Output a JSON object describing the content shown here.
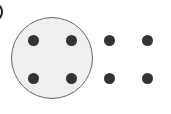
{
  "diagram": {
    "colors": {
      "background": "#ffffff",
      "circle_fill": "#efefef",
      "circle_border": "#666666",
      "dot": "#333333"
    },
    "group_circle": {
      "cx": 52,
      "cy": 58,
      "r": 41
    },
    "dot_diameter": 11,
    "dots": [
      {
        "x": 33,
        "y": 40,
        "grouped": true
      },
      {
        "x": 71,
        "y": 40,
        "grouped": true
      },
      {
        "x": 109,
        "y": 40,
        "grouped": false
      },
      {
        "x": 147,
        "y": 40,
        "grouped": false
      },
      {
        "x": 33,
        "y": 78,
        "grouped": true
      },
      {
        "x": 71,
        "y": 78,
        "grouped": true
      },
      {
        "x": 109,
        "y": 78,
        "grouped": false
      },
      {
        "x": 147,
        "y": 78,
        "grouped": false
      }
    ],
    "counts": {
      "total_dots": 8,
      "grouped_dots": 4
    }
  }
}
